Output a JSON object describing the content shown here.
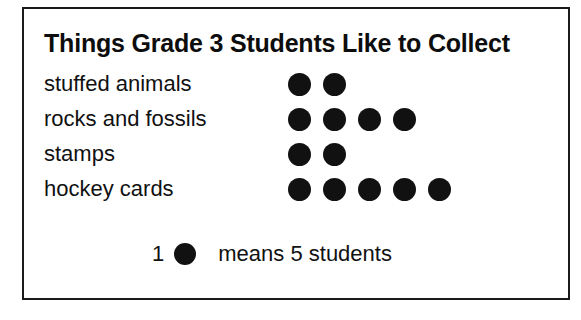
{
  "chart_data": {
    "type": "pictograph",
    "title": "Things Grade 3 Students Like to Collect",
    "categories": [
      "stuffed animals",
      "rocks and fossils",
      "stamps",
      "hockey cards"
    ],
    "icon_counts": [
      2,
      4,
      2,
      5
    ],
    "icons_shown": [
      [
        "dot",
        "dot"
      ],
      [
        "dot",
        "dot",
        "dot",
        "dot"
      ],
      [
        "dot",
        "dot"
      ],
      [
        "dot",
        "dot",
        "dot",
        "dot",
        "dot"
      ]
    ],
    "icon_value": 5,
    "values": [
      10,
      20,
      10,
      25
    ],
    "xlabel": "",
    "ylabel": "",
    "legend_position": "bottom-center",
    "grid": false,
    "colors": {
      "icon": "#111111",
      "text": "#111111",
      "border": "#1a1a1a",
      "background": "#ffffff"
    }
  },
  "card": {
    "title": "Things Grade 3 Students Like to Collect",
    "rows": [
      {
        "label": "stuffed animals",
        "icons": 2
      },
      {
        "label": "rocks and fossils",
        "icons": 4
      },
      {
        "label": "stamps",
        "icons": 2
      },
      {
        "label": "hockey cards",
        "icons": 5
      }
    ],
    "legend": {
      "count": "1",
      "icon": "dot-icon",
      "text": "means 5 students"
    }
  }
}
